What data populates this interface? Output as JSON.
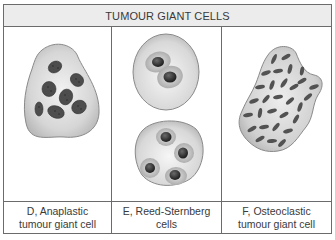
{
  "title": "TUMOUR GIANT CELLS",
  "panels": [
    {
      "id": "D",
      "caption_line1": "D, Anaplastic",
      "caption_line2": "tumour giant cell",
      "illustration": "anaplastic-giant-cell"
    },
    {
      "id": "E",
      "caption_line1": "E, Reed-Sternberg",
      "caption_line2": "cells",
      "illustration": "reed-sternberg-cells"
    },
    {
      "id": "F",
      "caption_line1": "F, Osteoclastic",
      "caption_line2": "tumour giant cell",
      "illustration": "osteoclastic-giant-cell"
    }
  ],
  "colors": {
    "border": "#6b6b6b",
    "header_bg": "#ececec",
    "cytoplasm": "#d4d4d4",
    "cytoplasm_edge": "#8a8a8a",
    "nucleus": "#4a4a4a"
  }
}
